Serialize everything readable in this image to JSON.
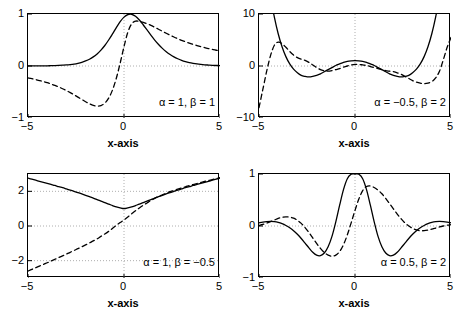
{
  "figure": {
    "layout": "2x2 grid of line plots",
    "background": "#ffffff",
    "axis_color": "#000000",
    "grid_color": "#999999",
    "solid_series_label": "solid",
    "dashed_series_label": "dashed"
  },
  "chart_data": [
    {
      "type": "line",
      "panel": "top-left",
      "title": "",
      "xlabel": "x-axis",
      "ylabel": "",
      "annotation": "α = 1, β = 1",
      "xlim": [
        -5,
        5
      ],
      "ylim": [
        -1,
        1
      ],
      "xticks": [
        -5,
        0,
        5
      ],
      "xticklabels": [
        "−5",
        "0",
        "5"
      ],
      "yticks": [
        -1,
        0,
        1
      ],
      "yticklabels": [
        "−1",
        "0",
        "1"
      ],
      "grid": true,
      "legend": "none",
      "x": [
        -5,
        -4.8,
        -4.6,
        -4.4,
        -4.2,
        -4,
        -3.8,
        -3.6,
        -3.4,
        -3.2,
        -3,
        -2.8,
        -2.6,
        -2.4,
        -2.2,
        -2,
        -1.8,
        -1.6,
        -1.4,
        -1.2,
        -1,
        -0.8,
        -0.6,
        -0.4,
        -0.2,
        0,
        0.2,
        0.4,
        0.6,
        0.8,
        1,
        1.2,
        1.4,
        1.6,
        1.8,
        2,
        2.2,
        2.4,
        2.6,
        2.8,
        3,
        3.2,
        3.4,
        3.6,
        3.8,
        4,
        4.2,
        4.4,
        4.6,
        4.8,
        5
      ],
      "series": [
        {
          "name": "solid",
          "style": "solid",
          "values": [
            0.001,
            0.001,
            0.002,
            0.002,
            0.003,
            0.004,
            0.006,
            0.008,
            0.011,
            0.015,
            0.02,
            0.028,
            0.038,
            0.052,
            0.071,
            0.097,
            0.13,
            0.175,
            0.232,
            0.305,
            0.394,
            0.5,
            0.617,
            0.739,
            0.852,
            0.94,
            0.99,
            0.995,
            0.955,
            0.884,
            0.793,
            0.693,
            0.593,
            0.499,
            0.414,
            0.339,
            0.275,
            0.221,
            0.176,
            0.139,
            0.109,
            0.085,
            0.066,
            0.051,
            0.039,
            0.03,
            0.023,
            0.018,
            0.013,
            0.01,
            0.008
          ]
        },
        {
          "name": "dashed",
          "style": "dashed",
          "values": [
            -0.23,
            -0.245,
            -0.262,
            -0.28,
            -0.3,
            -0.322,
            -0.347,
            -0.374,
            -0.404,
            -0.437,
            -0.473,
            -0.512,
            -0.554,
            -0.598,
            -0.643,
            -0.687,
            -0.726,
            -0.756,
            -0.77,
            -0.76,
            -0.714,
            -0.619,
            -0.462,
            -0.235,
            0.055,
            0.372,
            0.65,
            0.81,
            0.862,
            0.858,
            0.838,
            0.812,
            0.781,
            0.745,
            0.707,
            0.668,
            0.63,
            0.593,
            0.558,
            0.525,
            0.494,
            0.466,
            0.44,
            0.415,
            0.393,
            0.372,
            0.353,
            0.335,
            0.319,
            0.303,
            0.289
          ]
        }
      ]
    },
    {
      "type": "line",
      "panel": "top-right",
      "title": "",
      "xlabel": "x-axis",
      "ylabel": "",
      "annotation": "α = −0.5, β = 2",
      "xlim": [
        -5,
        5
      ],
      "ylim": [
        -10,
        10
      ],
      "xticks": [
        -5,
        0,
        5
      ],
      "xticklabels": [
        "−5",
        "0",
        "5"
      ],
      "yticks": [
        -10,
        0,
        10
      ],
      "yticklabels": [
        "−10",
        "0",
        "10"
      ],
      "grid": true,
      "legend": "none",
      "x": [
        -5,
        -4.8,
        -4.6,
        -4.4,
        -4.2,
        -4,
        -3.8,
        -3.6,
        -3.4,
        -3.2,
        -3,
        -2.8,
        -2.6,
        -2.4,
        -2.2,
        -2,
        -1.8,
        -1.6,
        -1.4,
        -1.2,
        -1,
        -0.8,
        -0.6,
        -0.4,
        -0.2,
        0,
        0.2,
        0.4,
        0.6,
        0.8,
        1,
        1.2,
        1.4,
        1.6,
        1.8,
        2,
        2.2,
        2.4,
        2.6,
        2.8,
        3,
        3.2,
        3.4,
        3.6,
        3.8,
        4,
        4.2,
        4.4,
        4.6,
        4.8,
        5
      ],
      "series": [
        {
          "name": "solid",
          "style": "solid",
          "values": [
            31.0,
            24.0,
            18.2,
            13.3,
            9.4,
            6.2,
            3.7,
            1.8,
            0.4,
            -0.6,
            -1.3,
            -1.8,
            -2.0,
            -2.1,
            -2.0,
            -1.8,
            -1.5,
            -1.1,
            -0.7,
            -0.3,
            0.1,
            0.4,
            0.7,
            0.9,
            1.0,
            1.05,
            1.0,
            0.9,
            0.7,
            0.4,
            0.1,
            -0.3,
            -0.7,
            -1.1,
            -1.5,
            -1.8,
            -2.0,
            -2.1,
            -2.0,
            -1.8,
            -1.3,
            -0.6,
            0.4,
            1.8,
            3.7,
            6.2,
            9.4,
            13.3,
            18.2,
            24.0,
            31.0
          ]
        },
        {
          "name": "dashed",
          "style": "dashed",
          "values": [
            -8.0,
            -4.5,
            -1.0,
            2.0,
            4.0,
            4.6,
            4.3,
            3.6,
            2.8,
            2.1,
            1.6,
            1.3,
            1.1,
            0.7,
            0.2,
            -0.3,
            -0.7,
            -0.9,
            -1.0,
            -0.9,
            -0.7,
            -0.5,
            -0.2,
            0.0,
            0.2,
            0.3,
            0.3,
            0.2,
            0.1,
            -0.1,
            -0.3,
            -0.5,
            -0.7,
            -0.9,
            -1.0,
            -1.1,
            -1.3,
            -1.6,
            -2.0,
            -2.4,
            -2.8,
            -3.1,
            -3.3,
            -3.4,
            -3.3,
            -3.0,
            -2.3,
            -1.0,
            1.2,
            3.6,
            5.5
          ]
        }
      ]
    },
    {
      "type": "line",
      "panel": "bottom-left",
      "title": "",
      "xlabel": "x-axis",
      "ylabel": "",
      "annotation": "α = 1, β = −0.5",
      "xlim": [
        -5,
        5
      ],
      "ylim": [
        -3,
        3
      ],
      "xticks": [
        -5,
        0,
        5
      ],
      "xticklabels": [
        "−5",
        "0",
        "5"
      ],
      "yticks": [
        -2,
        0,
        2
      ],
      "yticklabels": [
        "−2",
        "0",
        "2"
      ],
      "grid": true,
      "legend": "none",
      "x": [
        -5,
        -4.8,
        -4.6,
        -4.4,
        -4.2,
        -4,
        -3.8,
        -3.6,
        -3.4,
        -3.2,
        -3,
        -2.8,
        -2.6,
        -2.4,
        -2.2,
        -2,
        -1.8,
        -1.6,
        -1.4,
        -1.2,
        -1,
        -0.8,
        -0.6,
        -0.4,
        -0.2,
        0,
        0.2,
        0.4,
        0.6,
        0.8,
        1,
        1.2,
        1.4,
        1.6,
        1.8,
        2,
        2.2,
        2.4,
        2.6,
        2.8,
        3,
        3.2,
        3.4,
        3.6,
        3.8,
        4,
        4.2,
        4.4,
        4.6,
        4.8,
        5
      ],
      "series": [
        {
          "name": "solid",
          "style": "solid",
          "values": [
            2.76,
            2.7,
            2.64,
            2.58,
            2.52,
            2.46,
            2.4,
            2.34,
            2.27,
            2.21,
            2.14,
            2.07,
            2.0,
            1.93,
            1.85,
            1.77,
            1.69,
            1.61,
            1.52,
            1.43,
            1.35,
            1.26,
            1.18,
            1.1,
            1.04,
            1.0,
            1.04,
            1.1,
            1.18,
            1.26,
            1.35,
            1.43,
            1.52,
            1.61,
            1.69,
            1.77,
            1.85,
            1.93,
            2.0,
            2.07,
            2.14,
            2.21,
            2.27,
            2.34,
            2.4,
            2.46,
            2.52,
            2.58,
            2.64,
            2.7,
            2.76
          ]
        },
        {
          "name": "dashed",
          "style": "dashed",
          "values": [
            -2.6,
            -2.5,
            -2.41,
            -2.31,
            -2.22,
            -2.12,
            -2.02,
            -1.92,
            -1.82,
            -1.72,
            -1.62,
            -1.52,
            -1.41,
            -1.31,
            -1.2,
            -1.09,
            -0.98,
            -0.86,
            -0.74,
            -0.6,
            -0.46,
            -0.31,
            -0.14,
            0.04,
            0.2,
            0.35,
            0.52,
            0.7,
            0.88,
            1.04,
            1.19,
            1.33,
            1.47,
            1.59,
            1.7,
            1.8,
            1.89,
            1.98,
            2.05,
            2.13,
            2.2,
            2.26,
            2.33,
            2.39,
            2.45,
            2.51,
            2.57,
            2.62,
            2.68,
            2.73,
            2.79
          ]
        }
      ]
    },
    {
      "type": "line",
      "panel": "bottom-right",
      "title": "",
      "xlabel": "x-axis",
      "ylabel": "",
      "annotation": "α = 0.5, β = 2",
      "xlim": [
        -5,
        5
      ],
      "ylim": [
        -1,
        1
      ],
      "xticks": [
        -5,
        0,
        5
      ],
      "xticklabels": [
        "−5",
        "0",
        "5"
      ],
      "yticks": [
        -1,
        0,
        1
      ],
      "yticklabels": [
        "−1",
        "0",
        "1"
      ],
      "grid": true,
      "legend": "none",
      "x": [
        -5,
        -4.8,
        -4.6,
        -4.4,
        -4.2,
        -4,
        -3.8,
        -3.6,
        -3.4,
        -3.2,
        -3,
        -2.8,
        -2.6,
        -2.4,
        -2.2,
        -2,
        -1.8,
        -1.6,
        -1.4,
        -1.2,
        -1,
        -0.8,
        -0.6,
        -0.4,
        -0.2,
        0,
        0.2,
        0.4,
        0.6,
        0.8,
        1,
        1.2,
        1.4,
        1.6,
        1.8,
        2,
        2.2,
        2.4,
        2.6,
        2.8,
        3,
        3.2,
        3.4,
        3.6,
        3.8,
        4,
        4.2,
        4.4,
        4.6,
        4.8,
        5
      ],
      "series": [
        {
          "name": "solid",
          "style": "solid",
          "values": [
            0.06,
            0.075,
            0.085,
            0.09,
            0.085,
            0.07,
            0.045,
            0.01,
            -0.035,
            -0.09,
            -0.16,
            -0.24,
            -0.33,
            -0.42,
            -0.505,
            -0.56,
            -0.57,
            -0.52,
            -0.4,
            -0.2,
            0.08,
            0.4,
            0.7,
            0.91,
            0.995,
            1.0,
            0.995,
            0.91,
            0.7,
            0.4,
            0.08,
            -0.2,
            -0.4,
            -0.52,
            -0.57,
            -0.56,
            -0.505,
            -0.42,
            -0.33,
            -0.24,
            -0.16,
            -0.09,
            -0.035,
            0.01,
            0.045,
            0.07,
            0.085,
            0.09,
            0.085,
            0.075,
            0.06
          ]
        },
        {
          "name": "dashed",
          "style": "dashed",
          "values": [
            0.01,
            0.03,
            0.055,
            0.085,
            0.115,
            0.145,
            0.165,
            0.175,
            0.17,
            0.15,
            0.11,
            0.05,
            -0.03,
            -0.125,
            -0.23,
            -0.335,
            -0.43,
            -0.51,
            -0.56,
            -0.58,
            -0.56,
            -0.49,
            -0.36,
            -0.17,
            0.06,
            0.3,
            0.52,
            0.68,
            0.76,
            0.77,
            0.74,
            0.69,
            0.62,
            0.53,
            0.43,
            0.33,
            0.23,
            0.14,
            0.06,
            0.0,
            -0.045,
            -0.075,
            -0.09,
            -0.09,
            -0.08,
            -0.062,
            -0.04,
            -0.018,
            0.0,
            0.015,
            0.025
          ]
        }
      ]
    }
  ]
}
